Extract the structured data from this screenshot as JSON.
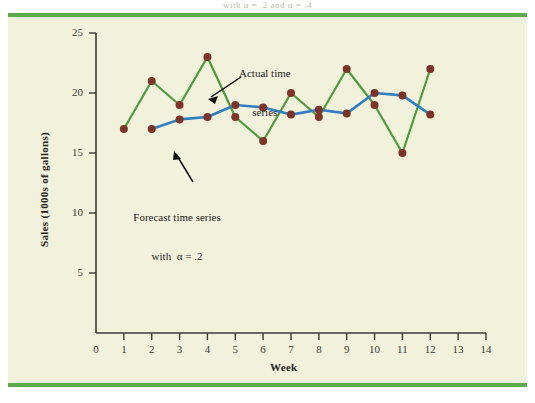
{
  "page": {
    "top_title_fragment": "with α = .2 and α = .4",
    "accent_rule_color": "#5faa4d",
    "panel_bg_color": "#f2f1dc"
  },
  "chart_data": {
    "type": "line",
    "title": "",
    "xlabel": "Week",
    "ylabel": "Sales (1000s of gallons)",
    "xlim": [
      0,
      14
    ],
    "ylim": [
      0,
      25
    ],
    "xticks": [
      0,
      1,
      2,
      3,
      4,
      5,
      6,
      7,
      8,
      9,
      10,
      11,
      12,
      13,
      14
    ],
    "yticks": [
      5,
      10,
      15,
      20,
      25
    ],
    "grid": false,
    "legend": "none",
    "x": [
      1,
      2,
      3,
      4,
      5,
      6,
      7,
      8,
      9,
      10,
      11,
      12
    ],
    "series": [
      {
        "name": "Actual time series",
        "color": "#4e9a3e",
        "marker_color": "#7b3427",
        "values": [
          17,
          21,
          19,
          23,
          18,
          16,
          20,
          18,
          22,
          19,
          15,
          22
        ]
      },
      {
        "name": "Forecast time series with α = .2",
        "color": "#2f7fc1",
        "marker_color": "#7b3427",
        "x": [
          2,
          3,
          4,
          5,
          6,
          7,
          8,
          9,
          10,
          11,
          12
        ],
        "values": [
          17.0,
          17.8,
          18.0,
          19.0,
          18.8,
          18.2,
          18.6,
          18.3,
          20.0,
          19.8,
          18.2
        ]
      }
    ],
    "annotations": [
      {
        "id": "actual-annotation",
        "text_line1": "Actual time",
        "text_line2": "series",
        "points_to": "actual series near week 4–5"
      },
      {
        "id": "forecast-annotation",
        "text_line1": "Forecast time series",
        "text_line2": "with  α = .2",
        "points_to": "forecast series near week 2"
      }
    ]
  },
  "axis": {
    "y_tick_labels": [
      "25",
      "20",
      "15",
      "10",
      "5"
    ],
    "x_tick_labels": [
      "0",
      "1",
      "2",
      "3",
      "4",
      "5",
      "6",
      "7",
      "8",
      "9",
      "10",
      "11",
      "12",
      "13",
      "14"
    ],
    "x_title": "Week",
    "y_title": "Sales (1000s of gallons)"
  }
}
